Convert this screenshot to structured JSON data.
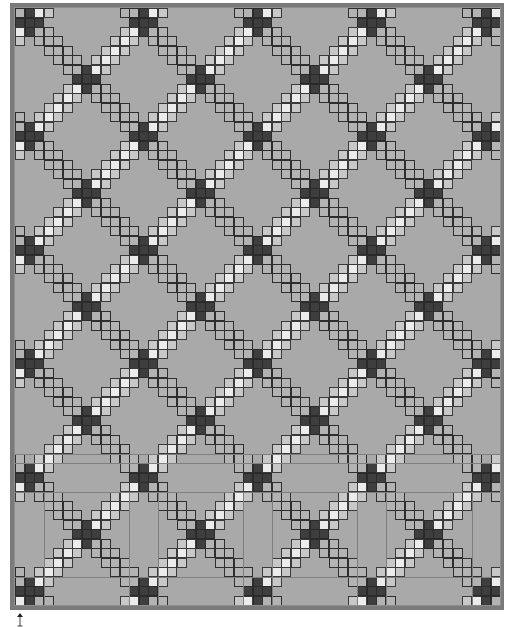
{
  "canvas": {
    "title": "Quilt design preview",
    "grid": {
      "cols": 51,
      "rows": 63,
      "cell_w": 9.51,
      "cell_h": 9.48
    },
    "repeat": 12,
    "crossing_rule": {
      "sum_mod": 2,
      "diff_mod": 0
    },
    "colors": {
      "background": "#a9a9a9",
      "dark": "#3e3e3e",
      "white": "#ececec",
      "gray": "#b3b3b3",
      "border": "#7a7a7a"
    },
    "block_lines_rows": [
      47,
      48,
      51,
      60
    ],
    "block_lines_cols_bottom": [
      3,
      12,
      15,
      24,
      27,
      36,
      39,
      48
    ]
  },
  "anchor": {
    "icon": "anchor-arrow-icon"
  }
}
